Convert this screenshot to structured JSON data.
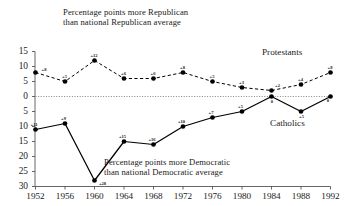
{
  "chart_data": {
    "type": "line",
    "title": "",
    "annotations": [
      {
        "name": "republican-note",
        "line1": "Percentage points more Republican",
        "line2": "than national Republican average"
      },
      {
        "name": "democratic-note",
        "line1": "Percentage points more Democratic",
        "line2": "than national Democratic average"
      }
    ],
    "x": [
      1952,
      1956,
      1960,
      1964,
      1968,
      1972,
      1976,
      1980,
      1984,
      1988,
      1992
    ],
    "xlabel": "",
    "ylabel": "",
    "xtick_labels": [
      "1952",
      "1956",
      "1960",
      "1964",
      "1968",
      "1972",
      "1976",
      "1980",
      "1984",
      "1988",
      "1992"
    ],
    "ytick_labels": [
      "15",
      "10",
      "5",
      "0",
      "5",
      "10",
      "15",
      "20",
      "25",
      "30"
    ],
    "ytick_values": [
      15,
      10,
      5,
      0,
      -5,
      -10,
      -15,
      -20,
      -25,
      -30
    ],
    "ylim": [
      -30,
      15
    ],
    "grid": false,
    "zero_line": true,
    "legend_position": "inline-right",
    "series": [
      {
        "name": "Protestants",
        "style": "dashed",
        "values": [
          8,
          5,
          12,
          6,
          6,
          8,
          5,
          3,
          2,
          4,
          8
        ],
        "point_labels": [
          "+8",
          "+5",
          "+12",
          "+6",
          "+6",
          "+8",
          "+5",
          "+3",
          "+2",
          "+4",
          "+8"
        ]
      },
      {
        "name": "Catholics",
        "style": "solid",
        "values": [
          -11,
          -9,
          -28,
          -15,
          -16,
          -10,
          -7,
          -5,
          0,
          -5,
          0
        ],
        "point_labels": [
          "+11",
          "+9",
          "+28",
          "+15",
          "+16",
          "+10",
          "+7",
          "+5",
          "0",
          "+5",
          "0"
        ]
      }
    ]
  },
  "axis": {
    "name": "axis"
  }
}
